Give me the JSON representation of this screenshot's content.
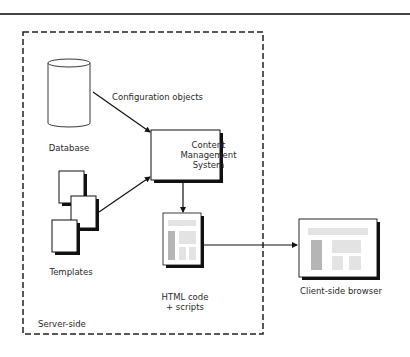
{
  "diagram": {
    "region": {
      "label": "Server-side"
    },
    "nodes": {
      "database": {
        "label": "Database",
        "icon": "database-cylinder-icon"
      },
      "cms": {
        "line1": "Content",
        "line2": "Management",
        "line3": "System"
      },
      "templates": {
        "label": "Templates",
        "icon": "stacked-documents-icon"
      },
      "html": {
        "line1": "HTML code",
        "line2": "+ scripts",
        "icon": "web-page-icon"
      },
      "browser": {
        "label": "Client-side browser",
        "icon": "browser-window-icon"
      }
    },
    "edges": {
      "db_to_cms": {
        "label": "Configuration objects"
      }
    },
    "colors": {
      "stroke": "#111111",
      "placeholder_light": "#e3e3e3",
      "placeholder_dark": "#b5b5b5"
    }
  }
}
